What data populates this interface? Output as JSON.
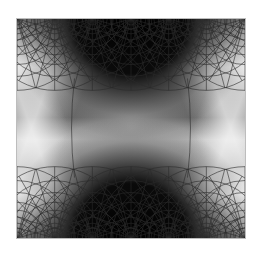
{
  "figure": {
    "colors": {
      "background": "#ffffff",
      "panel_mid": "#9a9a9a",
      "dark_poles": "#000000",
      "light_band": "#e6e6e6",
      "grid_line": "#2a2a2a",
      "frame": "#bdbdbd"
    },
    "panel": {
      "x": 16,
      "y": 18,
      "width": 230,
      "height": 221
    },
    "grid": {
      "top_arc_centers_x": [
        0,
        38,
        76,
        115,
        153,
        191,
        230
      ],
      "bottom_arc_centers_x": [
        0,
        38,
        76,
        115,
        153,
        191,
        230
      ],
      "arc_radii": [
        6,
        10,
        15,
        21,
        28,
        36,
        46,
        58,
        72
      ],
      "vertical_curves_x": [
        58,
        172
      ]
    }
  }
}
